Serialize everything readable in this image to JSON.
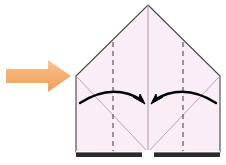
{
  "figure": {
    "background_color": "#ffffff",
    "caption": ""
  },
  "direction_arrow": {
    "name": "step-direction-arrow",
    "label": "next step",
    "color_light": "#f8c38c",
    "color_mid": "#f5b073",
    "color_dark": "#f0a363",
    "points_to": "right",
    "shaft": {
      "x": 5,
      "y": 69,
      "width": 44,
      "height": 14
    },
    "head": {
      "tip_x": 71,
      "back_x": 47,
      "top_y": 60,
      "bottom_y": 92
    }
  },
  "paper": {
    "name": "folded-paper",
    "fill": "#f9eef5",
    "outline_color": "#4a4046",
    "outline_width": 1.1,
    "apex": {
      "x": 148,
      "y": 5
    },
    "left_shoulder": {
      "x": 76,
      "y": 76
    },
    "right_shoulder": {
      "x": 220,
      "y": 76
    },
    "left_bottom": {
      "x": 76,
      "y": 152
    },
    "right_bottom": {
      "x": 220,
      "y": 152
    }
  },
  "creases": {
    "center_crease": {
      "name": "center-vertical-crease",
      "color": "#b69aa8",
      "x": 148,
      "y_top": 5,
      "y_bottom": 152,
      "style": "solid"
    },
    "diagonals": [
      {
        "name": "left-diagonal-crease",
        "color": "#b69aa8",
        "x1": 76,
        "y1": 76,
        "x2": 148,
        "y2": 152,
        "style": "solid"
      },
      {
        "name": "right-diagonal-crease",
        "color": "#b69aa8",
        "x1": 220,
        "y1": 76,
        "x2": 148,
        "y2": 152,
        "style": "solid"
      }
    ],
    "fold_lines": [
      {
        "name": "left-dashed-fold-line",
        "color": "#6b6069",
        "x": 113,
        "y_top": 42,
        "y_bottom": 152,
        "style": "dashed",
        "dash_pattern": "5,4"
      },
      {
        "name": "right-dashed-fold-line",
        "color": "#6b6069",
        "x": 183,
        "y_top": 42,
        "y_bottom": 152,
        "style": "dashed",
        "dash_pattern": "5,4"
      }
    ]
  },
  "motion_arrows": [
    {
      "name": "left-fold-motion-arrow",
      "color": "#000000",
      "direction": "right-inward",
      "path": "M 80 103 Q 112 82 143 100",
      "head": "M 143 100 L 146 106 L 136 102 Z"
    },
    {
      "name": "right-fold-motion-arrow",
      "color": "#000000",
      "direction": "left-inward",
      "path": "M 216 103 Q 184 82 153 100",
      "head": "M 153 100 L 150 106 L 160 102 Z"
    }
  ],
  "bottom_edge": {
    "name": "paper-bottom-edge-band",
    "band_color": "#2b2b2b",
    "highlight_color": "#ffffff",
    "gap_color": "#ffffff",
    "left_segment": {
      "x": 76,
      "width": 66
    },
    "right_segment": {
      "x": 154,
      "width": 66
    },
    "y": 152,
    "height": 6
  }
}
